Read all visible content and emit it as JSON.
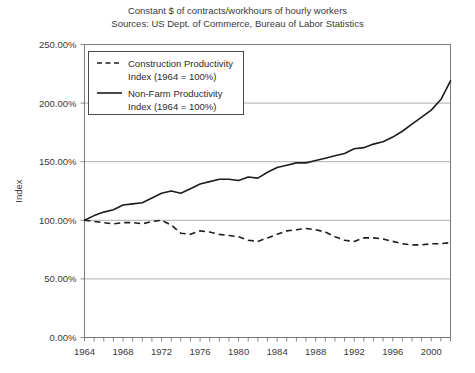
{
  "chart_data": {
    "type": "line",
    "title": "Constant $ of contracts/workhours of hourly workers",
    "subtitle": "Sources: US Dept. of Commerce, Bureau of Labor Statistics",
    "xlabel": "",
    "ylabel": "Index",
    "xlim": [
      1964,
      2002
    ],
    "ylim": [
      0,
      250
    ],
    "grid": true,
    "legend_position": "top-left inside plot",
    "ytick_labels": [
      "0.00%",
      "50.00%",
      "100.00%",
      "150.00%",
      "200.00%",
      "250.00%"
    ],
    "ytick_values": [
      0,
      50,
      100,
      150,
      200,
      250
    ],
    "xtick_labels": [
      "1964",
      "1968",
      "1972",
      "1976",
      "1980",
      "1984",
      "1988",
      "1992",
      "1996",
      "2000"
    ],
    "xtick_values": [
      1964,
      1968,
      1972,
      1976,
      1980,
      1984,
      1988,
      1992,
      1996,
      2000
    ],
    "xtick_minor_step": 1,
    "x": [
      1964,
      1965,
      1966,
      1967,
      1968,
      1969,
      1970,
      1971,
      1972,
      1973,
      1974,
      1975,
      1976,
      1977,
      1978,
      1979,
      1980,
      1981,
      1982,
      1983,
      1984,
      1985,
      1986,
      1987,
      1988,
      1989,
      1990,
      1991,
      1992,
      1993,
      1994,
      1995,
      1996,
      1997,
      1998,
      1999,
      2000,
      2001,
      2002
    ],
    "series": [
      {
        "name": "Construction Productivity Index (1964 = 100%)",
        "style": "dashed",
        "color": "#1d1d1d",
        "values": [
          100,
          99,
          98,
          97,
          98,
          98,
          97,
          99,
          100,
          96,
          89,
          88,
          91,
          90,
          88,
          87,
          86,
          83,
          82,
          85,
          88,
          91,
          92,
          93,
          92,
          90,
          86,
          83,
          82,
          85,
          85,
          84,
          82,
          80,
          79,
          79,
          80,
          80,
          81
        ]
      },
      {
        "name": "Non-Farm Productivity Index (1964 = 100%)",
        "style": "solid",
        "color": "#1d1d1d",
        "values": [
          100,
          104,
          107,
          109,
          113,
          114,
          115,
          119,
          123,
          125,
          123,
          127,
          131,
          133,
          135,
          135,
          134,
          137,
          136,
          141,
          145,
          147,
          149,
          149,
          151,
          153,
          155,
          157,
          161,
          162,
          165,
          167,
          171,
          176,
          182,
          188,
          194,
          203,
          219
        ]
      }
    ],
    "legend": [
      {
        "label_line1": "Construction Productivity",
        "label_line2": "Index (1964 = 100%)",
        "style": "dashed"
      },
      {
        "label_line1": "Non-Farm Productivity",
        "label_line2": "Index (1964 = 100%)",
        "style": "solid"
      }
    ]
  }
}
